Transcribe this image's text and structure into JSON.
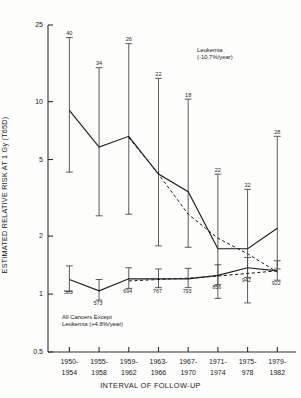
{
  "chart_data": {
    "type": "line",
    "title": "",
    "xlabel": "INTERVAL OF FOLLOW-UP",
    "ylabel": "ESTIMATED RELATIVE RISK AT 1 Gy (T65D)",
    "yscale": "log",
    "ylim": [
      0.5,
      25
    ],
    "yticks": [
      0.5,
      1,
      2,
      5,
      10,
      25
    ],
    "ytick_labels": [
      "0.5",
      "1",
      "2",
      "5",
      "10",
      "25"
    ],
    "grid": false,
    "legend": "annotations-inline",
    "categories": [
      "1950-1954",
      "1955-1958",
      "1959-1962",
      "1963-1966",
      "1967-1970",
      "1971-1974",
      "1975-978",
      "1979-1982"
    ],
    "xtick_lines": [
      [
        "1950-",
        "1954"
      ],
      [
        "1955-",
        "1958"
      ],
      [
        "1959-",
        "1962"
      ],
      [
        "1963-",
        "1966"
      ],
      [
        "1967-",
        "1970"
      ],
      [
        "1971-",
        "1974"
      ],
      [
        "1975-",
        "978"
      ],
      [
        "1979-",
        "1982"
      ]
    ],
    "series": [
      {
        "name": "Leukemia",
        "style": "solid",
        "annotation": "Leukemia (-10.7%/year)",
        "annotation_lines": [
          "Leukemia",
          "(-10.7%/year)"
        ],
        "trend_percent_per_year": -10.7,
        "values": [
          9.0,
          5.8,
          6.6,
          4.2,
          3.4,
          1.72,
          1.72,
          2.2
        ],
        "ci_low": [
          4.3,
          2.55,
          2.6,
          1.78,
          1.75,
          0.95,
          0.9,
          1.35
        ],
        "ci_high": [
          21.5,
          15.0,
          20.0,
          13.2,
          10.3,
          4.2,
          3.5,
          6.6
        ],
        "case_counts": [
          40,
          34,
          26,
          22,
          18,
          22,
          32,
          28
        ],
        "count_label_position": "above"
      },
      {
        "name": "All Cancers Except Leukemia",
        "style": "solid",
        "annotation": "All Cancers Except Leukemia (+4.8%/year)",
        "annotation_lines": [
          "All Cancers Except",
          "Leukemia (+4.8%/year)"
        ],
        "trend_percent_per_year": 4.8,
        "values": [
          1.19,
          1.04,
          1.2,
          1.2,
          1.2,
          1.25,
          1.37,
          1.32
        ],
        "ci_low": [
          1.03,
          0.93,
          1.07,
          1.08,
          1.08,
          1.12,
          1.22,
          1.18
        ],
        "ci_high": [
          1.4,
          1.19,
          1.37,
          1.35,
          1.36,
          1.42,
          1.55,
          1.49
        ],
        "case_counts": [
          503,
          573,
          694,
          767,
          793,
          856,
          942,
          922
        ],
        "count_label_position": "below"
      }
    ],
    "trend_lines": [
      {
        "name": "Leukemia fitted trend",
        "style": "dashed",
        "x_from": "1959-1962",
        "x_to": "1979-1982",
        "values": [
          null,
          null,
          6.5,
          4.2,
          2.6,
          1.95,
          1.62,
          1.3
        ]
      },
      {
        "name": "All Cancers Except Leukemia fitted trend",
        "style": "dashed",
        "x_from": "1959-1962",
        "x_to": "1979-1982",
        "values": [
          null,
          null,
          1.17,
          1.19,
          1.21,
          1.24,
          1.28,
          1.32
        ]
      }
    ]
  },
  "axis": {
    "y_title": "ESTIMATED RELATIVE RISK AT 1 Gy (T65D)",
    "x_title": "INTERVAL OF FOLLOW-UP"
  }
}
